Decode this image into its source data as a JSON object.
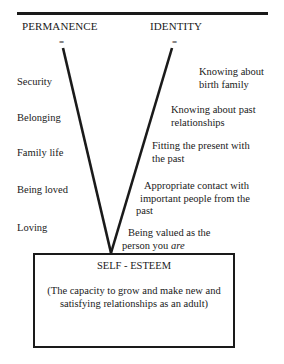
{
  "diagram": {
    "left_header": "PERMANENCE",
    "right_header": "IDENTITY",
    "equals_sign": "=",
    "permanence_items": [
      "Security",
      "Belonging",
      "Family life",
      "Being loved",
      "Loving"
    ],
    "identity_items": [
      {
        "line1": "Knowing about",
        "line2": "birth family"
      },
      {
        "line1": "Knowing about past",
        "line2": "relationships"
      },
      {
        "line1": "Fitting the present with",
        "line2": "the past"
      },
      {
        "line1": "Appropriate contact with",
        "line2": "important people from the",
        "line3": "past"
      },
      {
        "line1": "Being valued as the",
        "line2_prefix": "person you ",
        "line2_emph": "are"
      }
    ],
    "result_box": {
      "title": "SELF - ESTEEM",
      "description": "(The capacity to grow and make new and satisfying relationships as an adult)"
    },
    "colors": {
      "ink": "#1a1a1a",
      "background": "#ffffff"
    }
  }
}
